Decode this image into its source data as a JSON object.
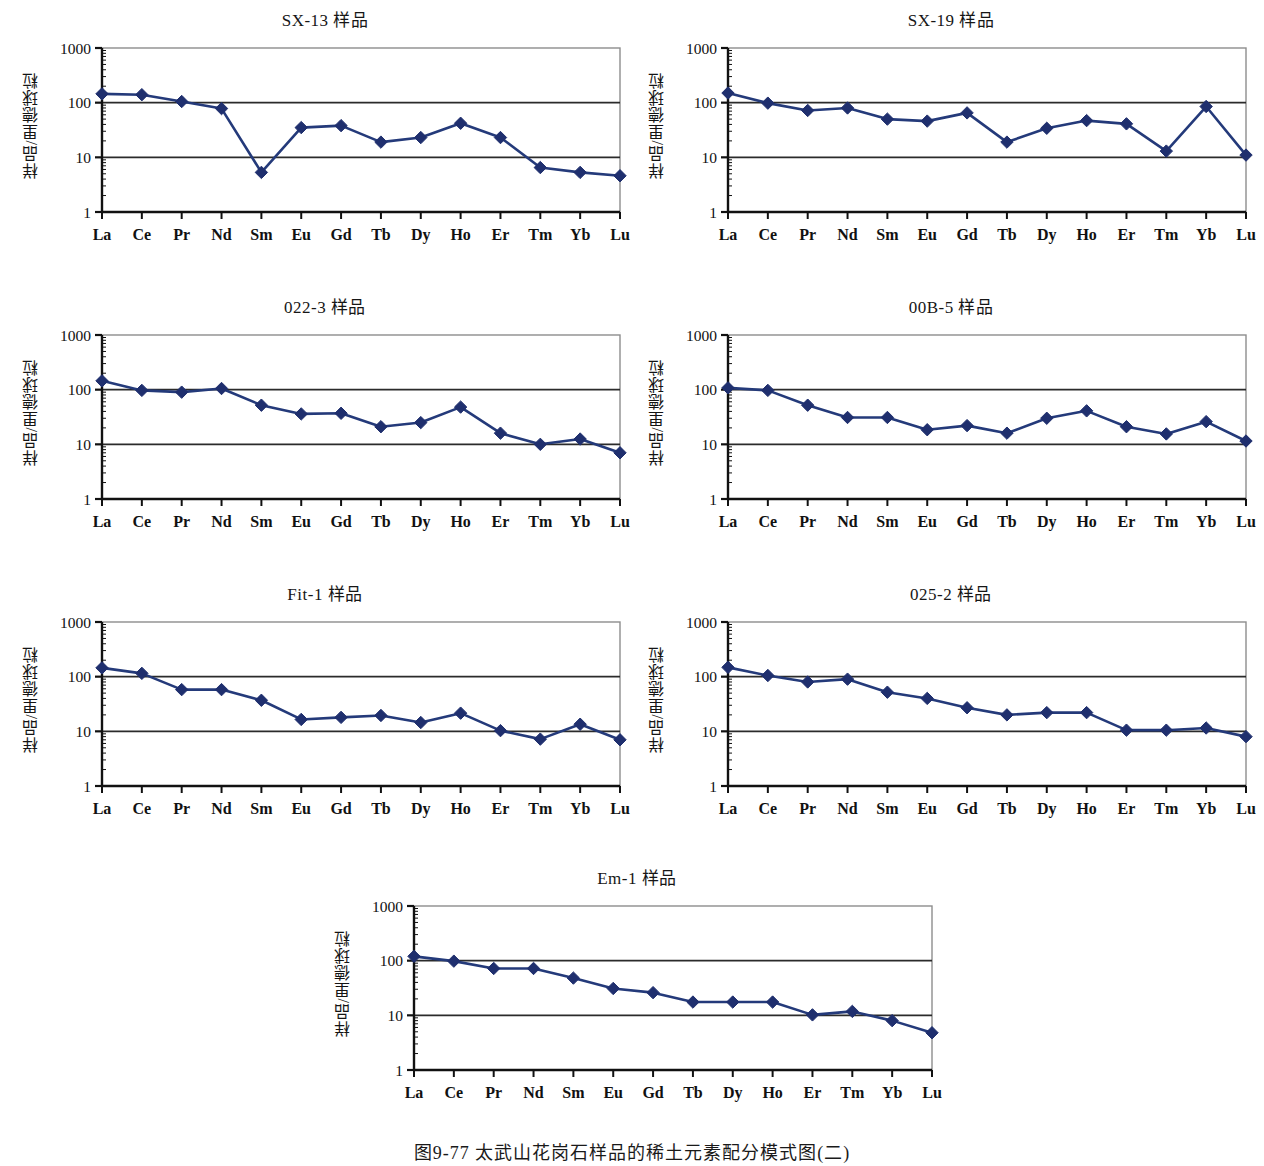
{
  "figure": {
    "caption": "图9-77  太武山花岗石样品的稀土元素配分模式图(二)",
    "y_axis_label": "样品/里德球粒",
    "y_ticks": [
      "1000",
      "100",
      "10",
      "1"
    ],
    "series_color": "#1f2f6e",
    "line_color": "#243a7a",
    "axis_color": "#111111",
    "grid_color": "#2b2b2b"
  },
  "chart_data": [
    {
      "type": "line",
      "title": "SX-13 样品",
      "xlabel": "",
      "ylabel": "样品/里德球粒",
      "categories": [
        "La",
        "Ce",
        "Pr",
        "Nd",
        "Sm",
        "Eu",
        "Gd",
        "Tb",
        "Dy",
        "Ho",
        "Er",
        "Tm",
        "Yb",
        "Lu"
      ],
      "values": [
        145,
        140,
        105,
        78,
        5.3,
        35,
        38,
        19,
        23,
        42,
        23,
        6.5,
        5.3,
        4.6
      ],
      "ylim": [
        1,
        1000
      ],
      "yscale": "log",
      "grid": true,
      "legend": "none"
    },
    {
      "type": "line",
      "title": "SX-19 样品",
      "xlabel": "",
      "ylabel": "样品/里德球粒",
      "categories": [
        "La",
        "Ce",
        "Pr",
        "Nd",
        "Sm",
        "Eu",
        "Gd",
        "Tb",
        "Dy",
        "Ho",
        "Er",
        "Tm",
        "Yb",
        "Lu"
      ],
      "values": [
        150,
        98,
        72,
        80,
        50,
        46,
        65,
        19,
        34,
        47,
        41,
        13,
        85,
        11
      ],
      "ylim": [
        1,
        1000
      ],
      "yscale": "log",
      "grid": true,
      "legend": "none"
    },
    {
      "type": "line",
      "title": "022-3 样品",
      "xlabel": "",
      "ylabel": "样品/里德球粒",
      "categories": [
        "La",
        "Ce",
        "Pr",
        "Nd",
        "Sm",
        "Eu",
        "Gd",
        "Tb",
        "Dy",
        "Ho",
        "Er",
        "Tm",
        "Yb",
        "Lu"
      ],
      "values": [
        145,
        97,
        90,
        105,
        52,
        36,
        37,
        21,
        25,
        48,
        16,
        10,
        12.5,
        7
      ],
      "ylim": [
        1,
        1000
      ],
      "yscale": "log",
      "grid": true,
      "legend": "none"
    },
    {
      "type": "line",
      "title": "00B-5 样品",
      "xlabel": "",
      "ylabel": "样品/里德球粒",
      "categories": [
        "La",
        "Ce",
        "Pr",
        "Nd",
        "Sm",
        "Eu",
        "Gd",
        "Tb",
        "Dy",
        "Ho",
        "Er",
        "Tm",
        "Yb",
        "Lu"
      ],
      "values": [
        108,
        97,
        52,
        31,
        31,
        18.5,
        22,
        16,
        30,
        41,
        21,
        15.5,
        26,
        11.5
      ],
      "ylim": [
        1,
        1000
      ],
      "yscale": "log",
      "grid": true,
      "legend": "none"
    },
    {
      "type": "line",
      "title": "Fit-1 样品",
      "xlabel": "",
      "ylabel": "样品/里德球粒",
      "categories": [
        "La",
        "Ce",
        "Pr",
        "Nd",
        "Sm",
        "Eu",
        "Gd",
        "Tb",
        "Dy",
        "Ho",
        "Er",
        "Tm",
        "Yb",
        "Lu"
      ],
      "values": [
        145,
        115,
        58,
        58,
        37,
        16.5,
        18,
        19.5,
        14.5,
        21.5,
        10.3,
        7.2,
        13.5,
        7
      ],
      "ylim": [
        1,
        1000
      ],
      "yscale": "log",
      "grid": true,
      "legend": "none"
    },
    {
      "type": "line",
      "title": "025-2 样品",
      "xlabel": "",
      "ylabel": "样品/里德球粒",
      "categories": [
        "La",
        "Ce",
        "Pr",
        "Nd",
        "Sm",
        "Eu",
        "Gd",
        "Tb",
        "Dy",
        "Ho",
        "Er",
        "Tm",
        "Yb",
        "Lu"
      ],
      "values": [
        148,
        105,
        80,
        90,
        52,
        40,
        27,
        20,
        22,
        22,
        10.5,
        10.5,
        11.5,
        8
      ],
      "ylim": [
        1,
        1000
      ],
      "yscale": "log",
      "grid": true,
      "legend": "none"
    },
    {
      "type": "line",
      "title": "Em-1 样品",
      "xlabel": "",
      "ylabel": "样品/里德球粒",
      "categories": [
        "La",
        "Ce",
        "Pr",
        "Nd",
        "Sm",
        "Eu",
        "Gd",
        "Tb",
        "Dy",
        "Ho",
        "Er",
        "Tm",
        "Yb",
        "Lu"
      ],
      "values": [
        120,
        98,
        72,
        72,
        48,
        31,
        26,
        17.5,
        17.5,
        17.5,
        10.2,
        11.8,
        8,
        4.8
      ],
      "ylim": [
        1,
        1000
      ],
      "yscale": "log",
      "grid": true,
      "legend": "none"
    }
  ],
  "panels": [
    {
      "name": "panel-sx-13",
      "x": 18,
      "y": 8,
      "w": 614,
      "h": 278
    },
    {
      "name": "panel-sx-19",
      "x": 644,
      "y": 8,
      "w": 614,
      "h": 278
    },
    {
      "name": "panel-022-3",
      "x": 18,
      "y": 295,
      "w": 614,
      "h": 278
    },
    {
      "name": "panel-00b-5",
      "x": 644,
      "y": 295,
      "w": 614,
      "h": 278
    },
    {
      "name": "panel-fit-1",
      "x": 18,
      "y": 582,
      "w": 614,
      "h": 278
    },
    {
      "name": "panel-025-2",
      "x": 644,
      "y": 582,
      "w": 614,
      "h": 278
    },
    {
      "name": "panel-em-1",
      "x": 330,
      "y": 866,
      "w": 614,
      "h": 278
    }
  ]
}
